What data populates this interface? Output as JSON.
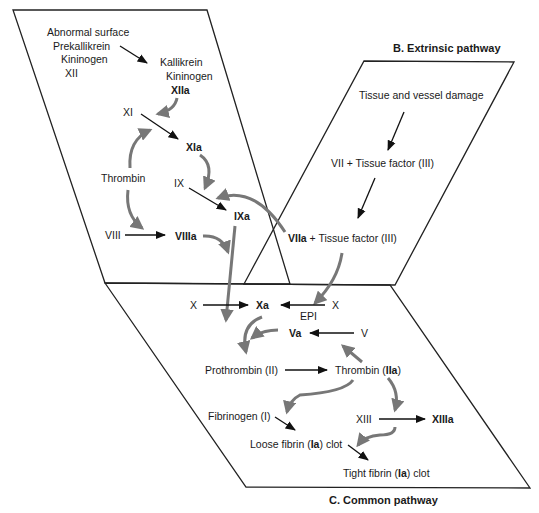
{
  "panels": {
    "intrinsic": {
      "nodes": {
        "abnormal_surface": "Abnormal surface",
        "prekallikrein": "Prekallikrein",
        "kininogen1": "Kininogen",
        "xii": "XII",
        "kallikrein": "Kallikrein",
        "kininogen2": "Kininogen",
        "xiia": "XIIa",
        "xi": "XI",
        "xia": "XIa",
        "thrombin": "Thrombin",
        "ix": "IX",
        "ixa": "IXa",
        "viii": "VIII",
        "viiia": "VIIIa"
      }
    },
    "extrinsic": {
      "title": "B. Extrinsic pathway",
      "nodes": {
        "damage": "Tissue and vessel damage",
        "vii_tf": "VII + Tissue factor (III)",
        "viia": "VIIa",
        "viia_tf_rest": " + Tissue factor (III)"
      }
    },
    "common": {
      "title": "C. Common pathway",
      "nodes": {
        "x_left": "X",
        "xa": "Xa",
        "x_right": "X",
        "epi": "EPI",
        "va": "Va",
        "v": "V",
        "prothrombin": "Prothrombin (II)",
        "thrombin_pre": "Thrombin (",
        "iia": "IIa",
        "close_paren": ")",
        "fibrinogen": "Fibrinogen (I)",
        "xiii": "XIII",
        "xiiia": "XIIIa",
        "loose_pre": "Loose fibrin (",
        "ia1": "Ia",
        "loose_post": ") clot",
        "tight_pre": "Tight fibrin (",
        "ia2": "Ia",
        "tight_post": ") clot"
      }
    }
  },
  "colors": {
    "panel_stroke": "#222222",
    "black_arrow": "#111111",
    "gray_arrow": "#777777"
  }
}
